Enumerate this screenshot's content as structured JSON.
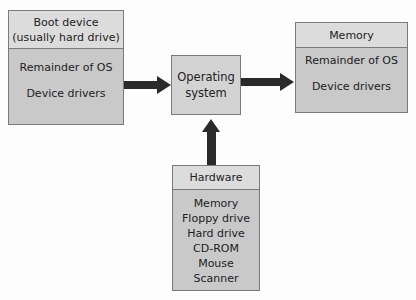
{
  "boot_device": {
    "title_line1": "Boot device",
    "title_line2": "(usually hard drive)",
    "items": [
      "Remainder of OS",
      "Device drivers"
    ]
  },
  "os": {
    "line1": "Operating",
    "line2": "system"
  },
  "memory": {
    "title": "Memory",
    "items": [
      "Remainder of OS",
      "Device drivers"
    ]
  },
  "hardware": {
    "title": "Hardware",
    "items": [
      "Memory",
      "Floppy drive",
      "Hard drive",
      "CD-ROM",
      "Mouse",
      "Scanner"
    ]
  }
}
